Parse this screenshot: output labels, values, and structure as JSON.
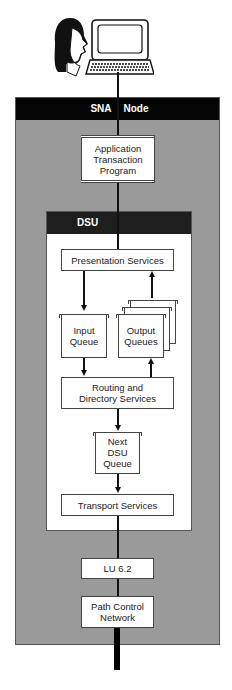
{
  "figure": {
    "user_icon": "person-head-icon",
    "terminal_icon": "computer-terminal-icon"
  },
  "sna_node": {
    "title_left": "SNA",
    "title_right": "Node",
    "application": {
      "line1": "Application",
      "line2": "Transaction",
      "line3": "Program"
    },
    "dsu": {
      "title": "DSU",
      "presentation_services": "Presentation Services",
      "input_queue": {
        "line1": "Input",
        "line2": "Queue"
      },
      "output_queues": {
        "line1": "Output",
        "line2": "Queues"
      },
      "routing": {
        "line1": "Routing and",
        "line2": "Directory Services"
      },
      "next_dsu_queue": {
        "line1": "Next",
        "line2": "DSU",
        "line3": "Queue"
      },
      "transport_services": "Transport Services"
    },
    "lu": "LU 6.2",
    "path_control": {
      "line1": "Path Control",
      "line2": "Network"
    }
  },
  "colors": {
    "node_background": "#9a9a9a",
    "header_background": "#050505",
    "dsu_header": "#1e1e1e",
    "box_background": "#ffffff"
  }
}
